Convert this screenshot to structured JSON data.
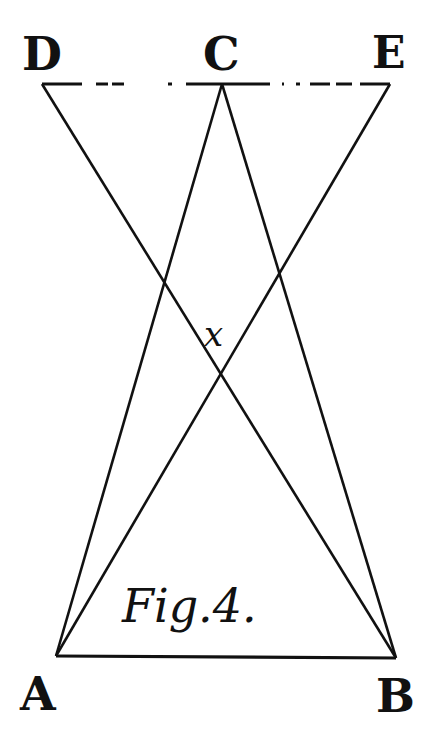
{
  "figure": {
    "caption": "Fig.4.",
    "ink_color": "#111111",
    "background": "#ffffff"
  },
  "points": {
    "D": {
      "label": "D",
      "x": 42,
      "y": 84
    },
    "C": {
      "label": "C",
      "x": 222,
      "y": 84
    },
    "E": {
      "label": "E",
      "x": 390,
      "y": 84
    },
    "A": {
      "label": "A",
      "x": 56,
      "y": 656
    },
    "B": {
      "label": "B",
      "x": 396,
      "y": 658
    },
    "x": {
      "label": "x",
      "x": 219,
      "y": 370
    }
  },
  "segments": [
    {
      "from": "D",
      "to": "E",
      "style": "dashed"
    },
    {
      "from": "A",
      "to": "B",
      "style": "solid"
    },
    {
      "from": "A",
      "to": "C",
      "style": "solid"
    },
    {
      "from": "B",
      "to": "C",
      "style": "solid"
    },
    {
      "from": "D",
      "to": "B",
      "style": "solid"
    },
    {
      "from": "E",
      "to": "A",
      "style": "solid"
    }
  ]
}
